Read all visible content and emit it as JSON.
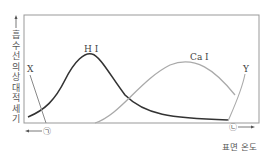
{
  "diagram": {
    "y_axis_label": "흡수선의 상대적 세기",
    "x_axis_label": "표면 온도",
    "x_left_marker": "㉠",
    "x_right_marker": "㉡",
    "curves": [
      {
        "name": "H I",
        "color": "#333333",
        "peak_position": "middle-left"
      },
      {
        "name": "Ca I",
        "color": "#aaaaaa",
        "peak_position": "middle-right"
      },
      {
        "name": "X",
        "color": "#888888",
        "trend": "decreasing"
      },
      {
        "name": "Y",
        "color": "#aaaaaa",
        "trend": "increasing"
      }
    ]
  }
}
